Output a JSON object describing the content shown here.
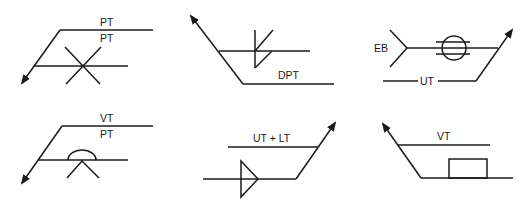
{
  "figure": {
    "symbols": [
      {
        "id": "symbol-1",
        "labels": {
          "top": "PT",
          "bottom": "PT"
        },
        "weld_symbol": "x-cross",
        "arrow_direction": "down-left"
      },
      {
        "id": "symbol-2",
        "labels": {
          "bottom": "DPT"
        },
        "weld_symbol": "flare-bevel-both-sides",
        "arrow_direction": "up-left"
      },
      {
        "id": "symbol-3",
        "labels": {
          "tail": "EB",
          "bottom": "UT"
        },
        "weld_symbol": "circle-with-parallel-lines",
        "arrow_direction": "up-right"
      },
      {
        "id": "symbol-4",
        "labels": {
          "top": "VT",
          "bottom": "PT"
        },
        "weld_symbol": "v-with-convex-contour",
        "arrow_direction": "down-left"
      },
      {
        "id": "symbol-5",
        "labels": {
          "top": "UT + LT"
        },
        "weld_symbol": "triangle-flag",
        "arrow_direction": "up-right"
      },
      {
        "id": "symbol-6",
        "labels": {
          "top": "VT"
        },
        "weld_symbol": "rectangle-plug",
        "arrow_direction": "up-left"
      }
    ]
  }
}
